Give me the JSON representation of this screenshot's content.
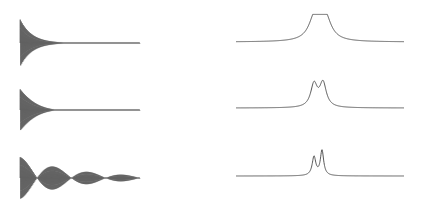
{
  "chart_data": [
    {
      "type": "line",
      "title": "",
      "panel": "time-domain signal 1 (fast decay, weak beating)",
      "xlabel": "",
      "ylabel": "",
      "grid": false,
      "layout": {
        "x0": 20,
        "x1": 140,
        "baseline": 43,
        "amp": 25
      },
      "params": {
        "decay": 0.085,
        "carrier_cycles": 60,
        "beat_cycles": 0.0,
        "beat_depth": 0.0
      }
    },
    {
      "type": "line",
      "title": "",
      "panel": "time-domain signal 2 (beating, moderate decay)",
      "xlabel": "",
      "ylabel": "",
      "grid": false,
      "layout": {
        "x0": 20,
        "x1": 140,
        "baseline": 110,
        "amp": 22
      },
      "params": {
        "decay": 0.06,
        "carrier_cycles": 60,
        "beat_cycles": 1.5,
        "beat_depth": 1.0
      }
    },
    {
      "type": "line",
      "title": "",
      "panel": "time-domain signal 3 (strong beating, slow decay)",
      "xlabel": "",
      "ylabel": "",
      "grid": false,
      "layout": {
        "x0": 20,
        "x1": 140,
        "baseline": 178,
        "amp": 22
      },
      "params": {
        "decay": 0.018,
        "carrier_cycles": 60,
        "beat_cycles": 3.5,
        "beat_depth": 1.0
      }
    },
    {
      "type": "line",
      "title": "",
      "panel": "spectrum 1 (broad doublet, barely resolved)",
      "xlabel": "",
      "ylabel": "",
      "grid": false,
      "layout": {
        "x0": 236,
        "x1": 404,
        "baseline": 42,
        "height": 24
      },
      "peaks": [
        {
          "center": 315,
          "width": 7.0,
          "height": 1.0
        },
        {
          "center": 325,
          "width": 7.0,
          "height": 1.0
        }
      ]
    },
    {
      "type": "line",
      "title": "",
      "panel": "spectrum 2 (partially resolved doublet)",
      "xlabel": "",
      "ylabel": "",
      "grid": false,
      "layout": {
        "x0": 236,
        "x1": 404,
        "baseline": 108,
        "height": 24
      },
      "peaks": [
        {
          "center": 314,
          "width": 4.0,
          "height": 0.95
        },
        {
          "center": 323,
          "width": 4.0,
          "height": 1.0
        }
      ]
    },
    {
      "type": "line",
      "title": "",
      "panel": "spectrum 3 (resolved doublet)",
      "xlabel": "",
      "ylabel": "",
      "grid": false,
      "layout": {
        "x0": 236,
        "x1": 404,
        "baseline": 176,
        "height": 25
      },
      "peaks": [
        {
          "center": 314,
          "width": 2.2,
          "height": 0.75
        },
        {
          "center": 322,
          "width": 2.0,
          "height": 1.0
        }
      ]
    }
  ],
  "colors": {
    "trace": "#3a3a3a",
    "spectrum": "#555555",
    "background": "#ffffff"
  }
}
